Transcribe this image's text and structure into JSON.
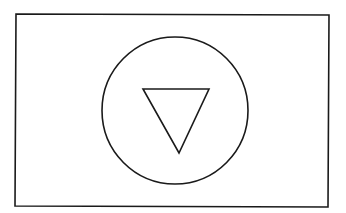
{
  "diagram": {
    "background": "#ffffff",
    "stroke": "#1a1a1a",
    "frame": {
      "x1": 16,
      "y1": 14,
      "x2": 329,
      "y2": 14,
      "x3": 328,
      "y3": 207,
      "x4": 15,
      "y4": 206
    },
    "circle": {
      "cx": 175,
      "cy": 111,
      "rx": 73,
      "ry": 73
    },
    "triangle": {
      "points": "143,89 209,89 179,153",
      "orientation": "pointing-down"
    }
  }
}
